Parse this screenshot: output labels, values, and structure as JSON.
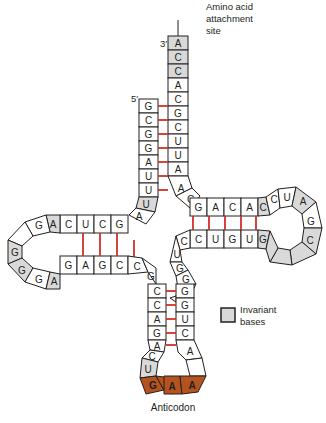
{
  "labels": {
    "three_prime": "3′",
    "five_prime": "5′",
    "amino_acid_site_line1": "Amino acid",
    "amino_acid_site_line2": "attachment",
    "amino_acid_site_line3": "site",
    "anticodon": "Anticodon",
    "legend_line1": "Invariant",
    "legend_line2": "bases"
  },
  "colors": {
    "invariant_fill": "#d9d9d9",
    "anticodon_fill": "#b5531f",
    "base_pair_line": "#d0302a",
    "outline": "#231f20"
  },
  "acceptor_stem": {
    "strand_3prime": [
      "A",
      "C",
      "C",
      "A",
      "C",
      "G",
      "C",
      "U",
      "U",
      "A"
    ],
    "strand_5prime": [
      "G",
      "C",
      "G",
      "G",
      "A",
      "U",
      "U"
    ]
  },
  "d_arm": {
    "top_strand": [
      "C",
      "U",
      "C",
      "G"
    ],
    "loop": [
      "A",
      "G",
      "",
      "G",
      "G",
      "G",
      "A"
    ],
    "bottom_strand": [
      "G",
      "A",
      "G",
      "C"
    ]
  },
  "t_arm": {
    "top_strand": [
      "G",
      "A",
      "C",
      "A",
      "C"
    ],
    "loop": [
      "C",
      "U",
      "A",
      "G",
      "C",
      "",
      ""
    ],
    "bottom_strand": [
      "C",
      "U",
      "G",
      "U",
      "G"
    ]
  },
  "variable_loop": [
    "C",
    "U",
    "G",
    "G",
    "A",
    "G"
  ],
  "anticodon_arm": {
    "left_strand": [
      "G",
      "C",
      "C",
      "A",
      "G",
      "A"
    ],
    "right_strand": [
      "G",
      "G",
      "U",
      "C",
      "A"
    ],
    "loop": [
      "C",
      "U",
      "G",
      "A",
      "A",
      "",
      "A"
    ],
    "anticodon": [
      "G",
      "A",
      "A"
    ]
  }
}
